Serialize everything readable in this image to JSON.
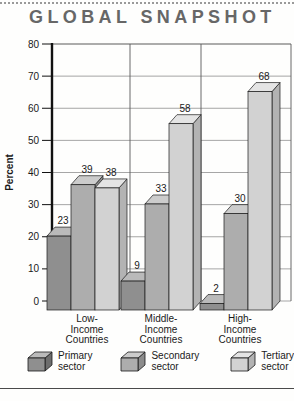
{
  "page_title": "GLOBAL SNAPSHOT",
  "chart_data": {
    "type": "bar",
    "style": "3d-column",
    "title": "GLOBAL SNAPSHOT",
    "xlabel": "",
    "ylabel": "Percent",
    "ylim": [
      0,
      80
    ],
    "yticks": [
      0,
      10,
      20,
      30,
      40,
      50,
      60,
      70,
      80
    ],
    "grid": true,
    "legend_position": "bottom",
    "categories": [
      "Low-Income Countries",
      "Middle-Income Countries",
      "High-Income Countries"
    ],
    "category_label_lines": [
      [
        "Low-",
        "Income",
        "Countries"
      ],
      [
        "Middle-",
        "Income",
        "Countries"
      ],
      [
        "High-",
        "Income",
        "Countries"
      ]
    ],
    "series": [
      {
        "name": "Primary sector",
        "label_lines": [
          "Primary",
          "sector"
        ],
        "values": [
          23,
          9,
          2
        ],
        "color_front": "#8f8f8f",
        "color_top": "#bababa",
        "color_side": "#6d6d6d"
      },
      {
        "name": "Secondary sector",
        "label_lines": [
          "Secondary",
          "sector"
        ],
        "values": [
          39,
          33,
          30
        ],
        "color_front": "#adadad",
        "color_top": "#cccccc",
        "color_side": "#8c8c8c"
      },
      {
        "name": "Tertiary sector",
        "label_lines": [
          "Tertiary",
          "sector"
        ],
        "values": [
          38,
          58,
          68
        ],
        "color_front": "#d2d2d2",
        "color_top": "#e4e4e4",
        "color_side": "#b3b3b3"
      }
    ],
    "value_labels": true
  },
  "colors": {
    "grid_line": "#8f8f8f",
    "frame_line": "#5a5a5a",
    "axis_line": "#111111",
    "bar_outline": "#1a1a1a",
    "title_color": "#676767",
    "text_color": "#1a1a1a"
  }
}
